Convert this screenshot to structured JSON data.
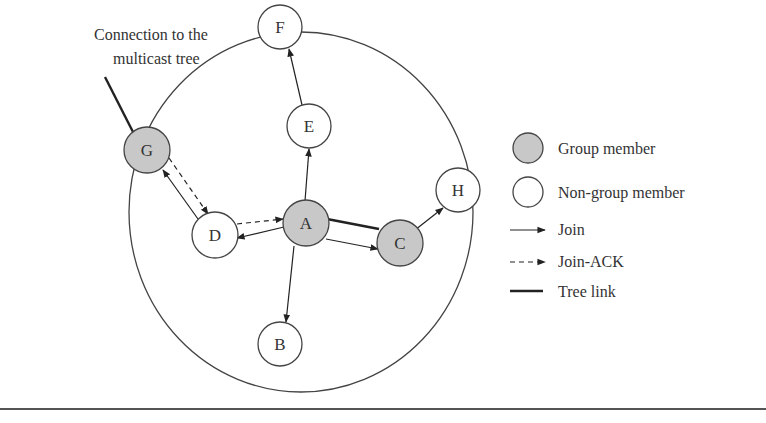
{
  "caption": {
    "line1": "Connection to the",
    "line2": "multicast tree"
  },
  "colors": {
    "group_fill": "#c8c8c8",
    "nongroup_fill": "#ffffff",
    "stroke": "#333333"
  },
  "nodes": [
    {
      "id": "A",
      "label": "A",
      "type": "group"
    },
    {
      "id": "B",
      "label": "B",
      "type": "non-group"
    },
    {
      "id": "C",
      "label": "C",
      "type": "group"
    },
    {
      "id": "D",
      "label": "D",
      "type": "non-group"
    },
    {
      "id": "E",
      "label": "E",
      "type": "non-group"
    },
    {
      "id": "F",
      "label": "F",
      "type": "non-group"
    },
    {
      "id": "G",
      "label": "G",
      "type": "group"
    },
    {
      "id": "H",
      "label": "H",
      "type": "non-group"
    }
  ],
  "edges": [
    {
      "from": "A",
      "to": "E",
      "kind": "join"
    },
    {
      "from": "E",
      "to": "F",
      "kind": "join"
    },
    {
      "from": "A",
      "to": "D",
      "kind": "join"
    },
    {
      "from": "D",
      "to": "G",
      "kind": "join"
    },
    {
      "from": "A",
      "to": "C",
      "kind": "join"
    },
    {
      "from": "C",
      "to": "H",
      "kind": "join"
    },
    {
      "from": "A",
      "to": "B",
      "kind": "join"
    },
    {
      "from": "G",
      "to": "D",
      "kind": "join-ack"
    },
    {
      "from": "D",
      "to": "A",
      "kind": "join-ack"
    },
    {
      "from": "A",
      "to": "C",
      "kind": "tree-link"
    },
    {
      "from": "G",
      "to": "external",
      "kind": "tree-link"
    }
  ],
  "legend": {
    "group_member": "Group member",
    "non_group_member": "Non-group member",
    "join": "Join",
    "join_ack": "Join-ACK",
    "tree_link": "Tree link"
  }
}
